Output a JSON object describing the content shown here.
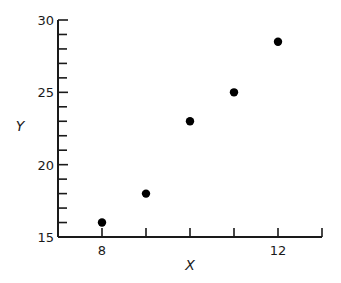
{
  "chart_data": {
    "type": "scatter",
    "title": "",
    "xlabel": "X",
    "ylabel": "Y",
    "xlim": [
      7,
      13
    ],
    "ylim": [
      15,
      30
    ],
    "x_ticks": [
      8,
      9,
      10,
      11,
      12,
      13
    ],
    "x_tick_labels": [
      "8",
      "",
      "",
      "",
      "12",
      ""
    ],
    "y_ticks": [
      15,
      16,
      17,
      18,
      19,
      20,
      21,
      22,
      23,
      24,
      25,
      26,
      27,
      28,
      29,
      30
    ],
    "y_tick_labels": [
      "15",
      "",
      "",
      "",
      "",
      "20",
      "",
      "",
      "",
      "",
      "25",
      "",
      "",
      "",
      "",
      "30"
    ],
    "grid": false,
    "legend": null,
    "series": [
      {
        "name": "data",
        "marker": "filled-circle",
        "color": "#000000",
        "points": [
          {
            "x": 8,
            "y": 16
          },
          {
            "x": 9,
            "y": 18
          },
          {
            "x": 10,
            "y": 23
          },
          {
            "x": 11,
            "y": 25
          },
          {
            "x": 12,
            "y": 28.5
          }
        ]
      }
    ]
  },
  "colors": {
    "ink": "#1a1a1a",
    "background": "#ffffff"
  }
}
